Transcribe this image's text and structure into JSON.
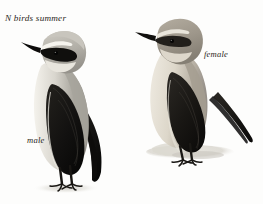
{
  "plate": {
    "background_color": "#fdfdfc",
    "caption": "N birds summer",
    "labels": {
      "male": "male",
      "female": "female"
    },
    "palette": {
      "ink": "#2b2722",
      "black": "#14120f",
      "dark_wing": "#1b1916",
      "mid_grey": "#9a9892",
      "crown_grey": "#b9b7b0",
      "pale_buff": "#e6e2d8",
      "white": "#f7f6f2",
      "shadow": "#cfcdc6",
      "ground": "#dedcd4",
      "female_head": "#a09a8e",
      "female_breast": "#ded8cc"
    },
    "subjects": [
      {
        "name": "male",
        "species_label": "male",
        "pose": "standing, facing left",
        "features": [
          "grey crown",
          "white supercilium",
          "black eye mask",
          "black bill",
          "grey mantle",
          "black wing",
          "pale buff underparts",
          "dark legs",
          "long dark tail"
        ]
      },
      {
        "name": "female",
        "species_label": "female",
        "pose": "standing on rock, facing left",
        "features": [
          "grey-brown head",
          "pale supercilium",
          "dark eye line",
          "brownish mantle",
          "dark brown wing",
          "buff underparts",
          "dark legs",
          "pointed dark tail"
        ]
      }
    ]
  }
}
